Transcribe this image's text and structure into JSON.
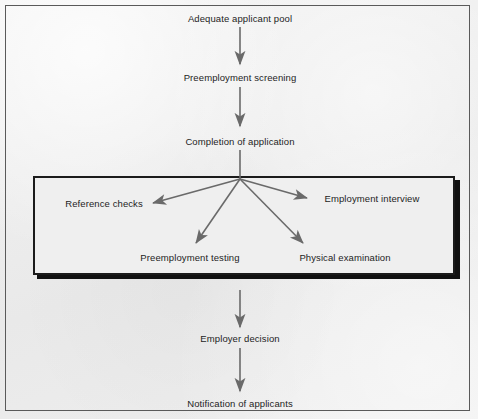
{
  "diagram": {
    "type": "flowchart",
    "orientation": "top-to-bottom",
    "background_color": "#ececec",
    "line_color": "#6a6a6a",
    "frame_color": "#5a5a5a",
    "emphasis_box_color": "#1b1b1b"
  },
  "nodes": {
    "adequate_applicant_pool": "Adequate applicant pool",
    "preemployment_screening": "Preemployment screening",
    "completion_of_application": "Completion of application",
    "reference_checks": "Reference checks",
    "employment_interview": "Employment interview",
    "preemployment_testing": "Preemployment testing",
    "physical_examination": "Physical examination",
    "employer_decision": "Employer decision",
    "notification_of_applicants": "Notification of applicants"
  },
  "groups": {
    "parallel_stage_label": "Parallel selection activities"
  },
  "edges": [
    {
      "from": "adequate_applicant_pool",
      "to": "preemployment_screening",
      "style": "solid-arrow"
    },
    {
      "from": "preemployment_screening",
      "to": "completion_of_application",
      "style": "solid-arrow"
    },
    {
      "from": "completion_of_application",
      "to": "parallel_stage_label",
      "style": "solid-line"
    },
    {
      "from": "parallel_stage_label",
      "to": "reference_checks",
      "style": "solid-arrow"
    },
    {
      "from": "parallel_stage_label",
      "to": "employment_interview",
      "style": "solid-arrow"
    },
    {
      "from": "parallel_stage_label",
      "to": "preemployment_testing",
      "style": "solid-arrow"
    },
    {
      "from": "parallel_stage_label",
      "to": "physical_examination",
      "style": "solid-arrow"
    },
    {
      "from": "parallel_stage_label",
      "to": "employer_decision",
      "style": "solid-arrow"
    },
    {
      "from": "employer_decision",
      "to": "notification_of_applicants",
      "style": "solid-arrow"
    }
  ]
}
